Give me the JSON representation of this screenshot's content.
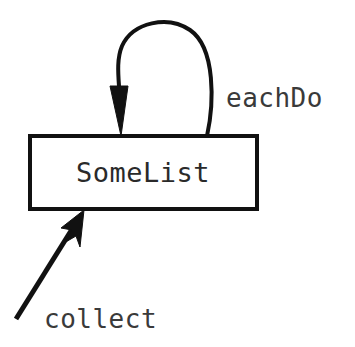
{
  "diagram": {
    "type": "object-message-diagram",
    "background_color": "#ffffff",
    "stroke_color": "#111111",
    "text_color": "#2a2a2a",
    "node": {
      "label": "SomeList",
      "shape": "rectangle",
      "fill_color": "#ffffff",
      "border_color": "#111111"
    },
    "edges": [
      {
        "name": "self-loop",
        "label": "eachDo",
        "style": "curved-self-loop",
        "direction": "returns-to-node",
        "arrowhead": "filled-triangle-down"
      },
      {
        "name": "incoming",
        "label": "collect",
        "style": "straight-diagonal",
        "direction": "into-node",
        "arrowhead": "filled-barbed-up-right"
      }
    ]
  }
}
